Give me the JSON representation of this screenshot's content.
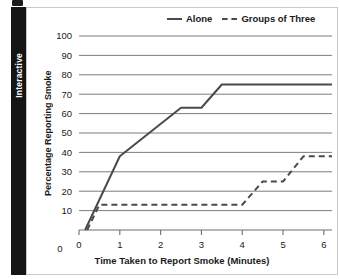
{
  "sidebar": {
    "label": "Interactive"
  },
  "chart_data": {
    "type": "line",
    "title": "",
    "xlabel": "Time Taken to Report Smoke (Minutes)",
    "ylabel": "Percentage Reporting Smoke",
    "xlim": [
      0,
      6.2
    ],
    "ylim": [
      0,
      100
    ],
    "xticks": [
      0,
      1,
      2,
      3,
      4,
      5,
      6
    ],
    "xtick_labels": [
      "0",
      "1",
      "2",
      "3",
      "4",
      "5",
      "6"
    ],
    "yticks": [
      10,
      20,
      30,
      40,
      50,
      60,
      70,
      80,
      90,
      100
    ],
    "ytick_labels": [
      "10",
      "20",
      "30",
      "40",
      "50",
      "60",
      "70",
      "80",
      "90",
      "100"
    ],
    "y_origin_label": "0",
    "grid": "horizontal",
    "legend_position": "top-right",
    "series": [
      {
        "name": "Alone",
        "style": "solid",
        "color": "#4a4a4a",
        "x": [
          0.15,
          1.0,
          2.5,
          3.0,
          3.5,
          6.2
        ],
        "y": [
          0,
          38,
          63,
          63,
          75,
          75
        ]
      },
      {
        "name": "Groups of Three",
        "style": "dashed",
        "color": "#4a4a4a",
        "x": [
          0.2,
          0.5,
          4.0,
          4.5,
          5.0,
          5.5,
          6.2
        ],
        "y": [
          0,
          13,
          13,
          25,
          25,
          38,
          38
        ]
      }
    ]
  }
}
